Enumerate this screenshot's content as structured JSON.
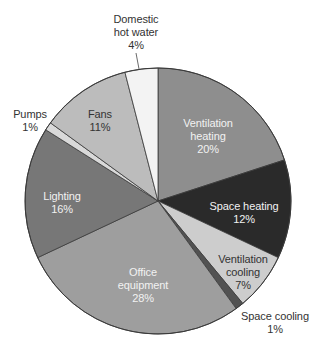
{
  "chart_data": {
    "type": "pie",
    "title": "",
    "start_angle_deg": 0,
    "direction": "clockwise",
    "center": [
      158,
      201
    ],
    "radius": 133,
    "slices": [
      {
        "label": "Ventilation heating",
        "line1": "Ventilation",
        "line2": "heating",
        "value": 20,
        "pct_text": "20%",
        "color": "#8e8e8e",
        "text_color": "#f2f2f2",
        "label_pos": [
          208,
          117
        ],
        "outside": false
      },
      {
        "label": "Space heating",
        "line1": "Space heating",
        "line2": "",
        "value": 12,
        "pct_text": "12%",
        "color": "#2a2a2a",
        "text_color": "#f2f2f2",
        "label_pos": [
          244,
          200
        ],
        "outside": false
      },
      {
        "label": "Ventilation cooling",
        "line1": "Ventilation",
        "line2": "cooling",
        "value": 7,
        "pct_text": "7%",
        "color": "#cdcdcd",
        "text_color": "#333333",
        "label_pos": [
          243,
          253
        ],
        "outside": false
      },
      {
        "label": "Space cooling",
        "line1": "Space cooling",
        "line2": "",
        "value": 1,
        "pct_text": "1%",
        "color": "#525252",
        "text_color": "#333333",
        "label_pos": [
          275,
          310
        ],
        "outside": true
      },
      {
        "label": "Office equipment",
        "line1": "Office",
        "line2": "equipment",
        "value": 28,
        "pct_text": "28%",
        "color": "#9e9e9e",
        "text_color": "#f2f2f2",
        "label_pos": [
          143,
          266
        ],
        "outside": false
      },
      {
        "label": "Lighting",
        "line1": "Lighting",
        "line2": "",
        "value": 16,
        "pct_text": "16%",
        "color": "#777777",
        "text_color": "#f2f2f2",
        "label_pos": [
          62,
          190
        ],
        "outside": false
      },
      {
        "label": "Pumps",
        "line1": "Pumps",
        "line2": "",
        "value": 1,
        "pct_text": "1%",
        "color": "#d9d9d9",
        "text_color": "#333333",
        "label_pos": [
          30,
          108
        ],
        "outside": true
      },
      {
        "label": "Fans",
        "line1": "Fans",
        "line2": "",
        "value": 11,
        "pct_text": "11%",
        "color": "#bcbcbc",
        "text_color": "#333333",
        "label_pos": [
          100,
          108
        ],
        "outside": false
      },
      {
        "label": "Domestic hot water",
        "line1": "Domestic",
        "line2": "hot water",
        "value": 4,
        "pct_text": "4%",
        "color": "#f3f3f3",
        "text_color": "#333333",
        "label_pos": [
          136,
          13
        ],
        "outside": true
      }
    ],
    "leader_lines": [
      {
        "slice": "Domestic hot water",
        "from": [
          136,
          53
        ],
        "to": [
          139,
          69
        ]
      }
    ],
    "stroke_color": "#3a3a3a",
    "legend": "none"
  }
}
